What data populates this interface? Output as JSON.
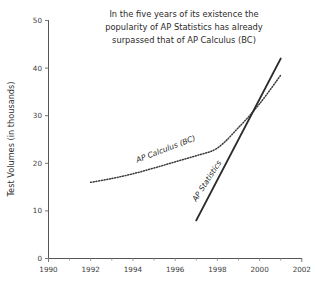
{
  "chart_data": {
    "type": "line",
    "title": "In the five years of its existence the popularity of AP Statistics has already surpassed that of AP Calculus (BC)",
    "title_lines": [
      "In the five years of its existence the",
      "popularity of AP Statistics has already",
      "surpassed that of AP Calculus (BC)"
    ],
    "xlabel": "",
    "ylabel": "Test Volumes (in thousands)",
    "xlim": [
      1990,
      2002
    ],
    "ylim": [
      0,
      50
    ],
    "grid": false,
    "legend_position": "inline-annotations",
    "x_ticks": [
      1990,
      1992,
      1994,
      1996,
      1998,
      2000,
      2002
    ],
    "x_tick_labels": [
      "1990",
      "1992",
      "1994",
      "1996",
      "1998",
      "2000",
      "2002"
    ],
    "x_minor_ticks": [
      1991,
      1993,
      1995,
      1997,
      1999,
      2001
    ],
    "y_ticks": [
      0,
      10,
      20,
      30,
      40,
      50
    ],
    "y_tick_labels": [
      "0",
      "10",
      "20",
      "30",
      "40",
      "50"
    ],
    "series": [
      {
        "name": "AP Calculus (BC)",
        "style": "dotted",
        "annotation": "AP Calculus (BC)",
        "x": [
          1992,
          1993,
          1994,
          1995,
          1996,
          1997,
          1998,
          1999,
          2000,
          2001
        ],
        "values": [
          16.0,
          16.8,
          17.8,
          19.0,
          20.3,
          21.6,
          23.2,
          27.5,
          32.5,
          38.5
        ]
      },
      {
        "name": "AP Statistics",
        "style": "solid",
        "annotation": "AP Statistics",
        "x": [
          1997,
          2001
        ],
        "values": [
          8.0,
          42.0
        ]
      }
    ],
    "annotations": [
      {
        "text": "AP Calculus (BC)",
        "x": 1995.6,
        "y": 22.5,
        "rotation": -21
      },
      {
        "text": "AP Statistics",
        "x": 1997.6,
        "y": 16.0,
        "rotation": -57
      }
    ],
    "colors": {
      "axis": "#555555",
      "solid_series": "#2b2b2b",
      "dotted_series": "#3a3a3a",
      "text": "#2b2b2b",
      "background": "#ffffff"
    }
  }
}
